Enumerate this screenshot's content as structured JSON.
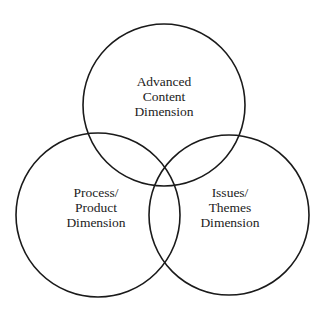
{
  "diagram": {
    "type": "venn",
    "stroke_color": "#1a1a1a",
    "circles": [
      {
        "id": "top",
        "cx": 164,
        "cy": 105,
        "r": 81,
        "lines": [
          "Advanced",
          "Content",
          "Dimension"
        ]
      },
      {
        "id": "left",
        "cx": 98,
        "cy": 215,
        "r": 82,
        "lines": [
          "Process/",
          "Product",
          "Dimension"
        ]
      },
      {
        "id": "right",
        "cx": 229,
        "cy": 215,
        "r": 80,
        "lines": [
          "Issues/",
          "Themes",
          "Dimension"
        ]
      }
    ]
  }
}
